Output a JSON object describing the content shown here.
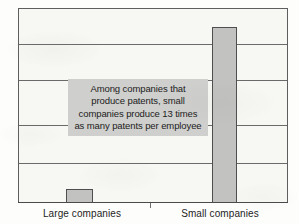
{
  "chart_data": {
    "type": "bar",
    "title": "",
    "subtitle": "",
    "xlabel": "",
    "ylabel": "",
    "categories": [
      "Large companies",
      "Small companies"
    ],
    "values": [
      1,
      13
    ],
    "ylim": [
      0,
      14.4
    ],
    "grid": true,
    "gridlines_count": 4,
    "legend": "none",
    "series": [
      {
        "name": "Patents per employee",
        "values": [
          1,
          13
        ]
      }
    ],
    "annotations": [
      {
        "name": "callout",
        "lines": [
          "Among companies that",
          "produce patents, small",
          "companies produce 13 times",
          "as many patents per employee"
        ],
        "text": "Among companies that produce patents, small companies produce 13 times as many patents per employee"
      }
    ],
    "colors": {
      "bar_fill": "#c2c2c0",
      "bar_outline": "#4f4f4f",
      "plot_background": "#f7f7f4",
      "gridline": "#6a6a6a",
      "annotation_background": "#cfcfcd",
      "text": "#1d1d1d"
    }
  },
  "annotation": {
    "line1": "Among companies that",
    "line2": "produce patents, small",
    "line3": "companies produce 13 times",
    "line4": "as many patents per employee"
  },
  "axis": {
    "category_large": "Large companies",
    "category_small": "Small companies"
  }
}
